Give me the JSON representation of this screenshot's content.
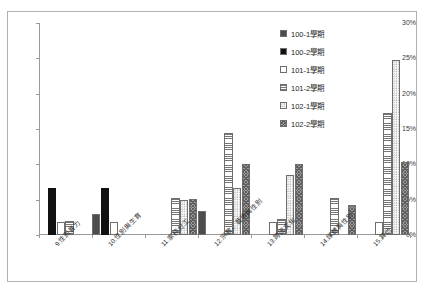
{
  "chart_data": {
    "type": "bar",
    "title": "",
    "xlabel": "",
    "ylabel": "",
    "ylim": [
      0,
      30
    ],
    "ytick_labels": [
      "0%",
      "5%",
      "10%",
      "15%",
      "20%",
      "25%",
      "30%"
    ],
    "ytick_values": [
      0,
      5,
      10,
      15,
      20,
      25,
      30
    ],
    "grid": false,
    "legend_position": "top-right",
    "categories": [
      "9.性別暴力",
      "10.性別與生育",
      "11.家務分工",
      "12.宗教、藝術與性別",
      "13.跨國文化",
      "14.媒體與性別",
      "15.其他"
    ],
    "series": [
      {
        "name": "100-1學期",
        "values": [
          0.0,
          3.0,
          0.0,
          3.4,
          0.0,
          0.0,
          0.0
        ]
      },
      {
        "name": "100-2學期",
        "values": [
          6.6,
          6.7,
          0.0,
          0.0,
          0.0,
          0.0,
          0.0
        ]
      },
      {
        "name": "101-1學期",
        "values": [
          1.8,
          1.8,
          0.0,
          0.0,
          1.8,
          0.0,
          1.8
        ]
      },
      {
        "name": "101-2學期",
        "values": [
          2.0,
          0.0,
          5.2,
          14.4,
          2.3,
          5.2,
          17.2
        ]
      },
      {
        "name": "102-1學期",
        "values": [
          0.0,
          0.0,
          4.9,
          6.6,
          8.5,
          0.0,
          24.8
        ]
      },
      {
        "name": "102-2學期",
        "values": [
          0.0,
          0.0,
          5.1,
          10.0,
          10.0,
          4.2,
          10.4
        ]
      }
    ]
  },
  "legend": {
    "items": [
      {
        "label": "100-1學期",
        "pattern": "p-s1"
      },
      {
        "label": "100-2學期",
        "pattern": "p-s2"
      },
      {
        "label": "101-1學期",
        "pattern": "p-s3"
      },
      {
        "label": "101-2學期",
        "pattern": "p-s4"
      },
      {
        "label": "102-1學期",
        "pattern": "p-s5"
      },
      {
        "label": "102-2學期",
        "pattern": "p-s6"
      }
    ]
  },
  "colors": {
    "axis": "#9a9a9a",
    "border": "#b0b0b0",
    "text": "#2e2e2e",
    "series_1": "#8d8d8d",
    "series_2": "#111111",
    "series_3": "#ffffff",
    "series_4": "#767676",
    "series_5": "#fbfbfb",
    "series_6": "#9d9d9d"
  }
}
